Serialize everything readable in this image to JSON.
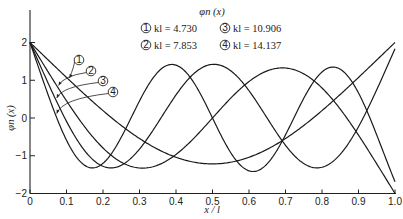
{
  "chart_data": {
    "type": "line",
    "xlabel": "x/l",
    "ylabel": "φn(x)",
    "xlim": [
      0,
      1.0
    ],
    "ylim": [
      -2,
      2
    ],
    "grid": false,
    "legend_position": "top-center",
    "x_ticks": [
      "0",
      "0.1",
      "0.2",
      "0.3",
      "0.4",
      "0.5",
      "0.6",
      "0.7",
      "0.8",
      "0.9",
      "1.0"
    ],
    "y_ticks": [
      "2",
      "1",
      "0",
      "-1",
      "-2"
    ],
    "x": [
      0,
      0.1,
      0.2,
      0.3,
      0.4,
      0.5,
      0.6,
      0.7,
      0.8,
      0.9,
      1.0
    ],
    "series": [
      {
        "name": "① kl = 4.730",
        "id": "1",
        "kl": 4.73,
        "sigma": 0.982502,
        "values": [
          2.0,
          1.07,
          0.2,
          -0.54,
          -1.04,
          -1.22,
          -1.04,
          -0.54,
          0.2,
          1.07,
          2.0
        ]
      },
      {
        "name": "② kl = 7.853",
        "id": "2",
        "kl": 7.853,
        "sigma": 1.000777,
        "values": [
          2.0,
          0.54,
          -0.78,
          -1.32,
          -0.85,
          0.0,
          0.85,
          1.32,
          0.78,
          -0.54,
          -2.0
        ]
      },
      {
        "name": "③ kl = 10.906",
        "id": "3",
        "kl": 10.906,
        "sigma": 0.999966,
        "values": [
          2.0,
          0.11,
          -1.27,
          -0.88,
          0.51,
          1.41,
          0.51,
          -0.88,
          -1.27,
          0.11,
          2.0
        ]
      },
      {
        "name": "④ kl = 14.137",
        "id": "4",
        "kl": 14.137,
        "sigma": 1.000001,
        "values": [
          2.0,
          -0.28,
          -1.41,
          0.01,
          1.41,
          0.0,
          -1.41,
          -0.01,
          1.41,
          0.28,
          -2.0
        ]
      }
    ],
    "annotations": [
      "①",
      "②",
      "③",
      "④"
    ]
  },
  "legend": {
    "title": "φn (x)",
    "items": [
      {
        "num": "1",
        "text": "kl = 4.730"
      },
      {
        "num": "2",
        "text": "kl = 7.853"
      },
      {
        "num": "3",
        "text": "kl = 10.906"
      },
      {
        "num": "4",
        "text": "kl = 14.137"
      }
    ]
  },
  "axes": {
    "xlabel": "x / l",
    "ylabel": "φn (x)",
    "x_ticks": [
      "0",
      "0.1",
      "0.2",
      "0.3",
      "0.4",
      "0.5",
      "0.6",
      "0.7",
      "0.8",
      "0.9",
      "1.0"
    ],
    "y_ticks": [
      "2",
      "1",
      "0",
      "-1",
      "-2"
    ]
  },
  "callouts": [
    {
      "num": "1",
      "circle": [
        79,
        60
      ],
      "target_x": 0.105
    },
    {
      "num": "2",
      "circle": [
        91,
        71
      ],
      "target_x": 0.075
    },
    {
      "num": "3",
      "circle": [
        103,
        81
      ],
      "target_x": 0.07
    },
    {
      "num": "4",
      "circle": [
        113,
        92
      ],
      "target_x": 0.07
    }
  ],
  "style": {
    "line_color": "#1a1a1a",
    "background": "#ffffff"
  }
}
